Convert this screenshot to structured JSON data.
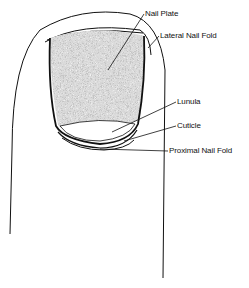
{
  "diagram": {
    "colors": {
      "line": "#111111",
      "background": "#ffffff",
      "nail_plate_fill": "#bdbdbd",
      "lunula_fill": "#ffffff"
    },
    "labels": [
      {
        "id": "nail-plate",
        "text": "Nail Plate",
        "x": 145,
        "y": 10
      },
      {
        "id": "lateral-nail-fold",
        "text": "Lateral Nail Fold",
        "x": 160,
        "y": 32
      },
      {
        "id": "lunula",
        "text": "Lunula",
        "x": 177,
        "y": 98
      },
      {
        "id": "cuticle",
        "text": "Cuticle",
        "x": 177,
        "y": 122
      },
      {
        "id": "proximal-nail-fold",
        "text": "Proximal Nail Fold",
        "x": 169,
        "y": 147
      }
    ]
  }
}
